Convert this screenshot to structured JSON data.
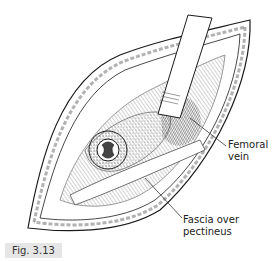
{
  "figure": {
    "caption": "Fig. 3.13",
    "labels": {
      "femoral_vein": [
        "Femoral",
        "vein"
      ],
      "fascia": [
        "Fascia over",
        "pectineus"
      ]
    },
    "colors": {
      "line": "#1a1a1a",
      "shade": "#555555",
      "caption_bg": "#e6e6e6"
    }
  }
}
